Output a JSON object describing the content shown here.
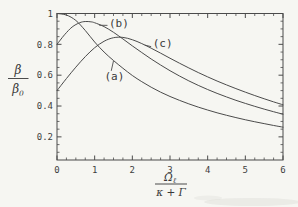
{
  "figure": {
    "background": "#f6f6f2",
    "ink": "#4b4b4b",
    "text_ink": "#3e3e3e"
  },
  "axis_labels": {
    "y_num": "β",
    "y_den_base": "β",
    "y_den_sub": "0",
    "x_num_base": "Ω",
    "x_num_sub": "ℓ",
    "x_den": "κ + Γ"
  },
  "chart_data": {
    "type": "line",
    "title": "",
    "xlabel": "Ω_ℓ / (κ + Γ)",
    "ylabel": "β / β_0",
    "xlim": [
      0,
      6
    ],
    "ylim": [
      0.05,
      1.0
    ],
    "x_ticks": [
      0,
      1,
      2,
      3,
      4,
      5,
      6
    ],
    "y_ticks": [
      0.2,
      0.4,
      0.6,
      0.8,
      1
    ],
    "x_minor_step": 0.25,
    "y_minor_step": 0.05,
    "grid": false,
    "frame": true,
    "legend_position": "none",
    "series": [
      {
        "name": "(a)",
        "points": [
          [
            0,
            1.0
          ],
          [
            0.25,
            0.99
          ],
          [
            0.5,
            0.955
          ],
          [
            0.75,
            0.89
          ],
          [
            1,
            0.815
          ],
          [
            1.25,
            0.75
          ],
          [
            1.5,
            0.695
          ],
          [
            1.75,
            0.645
          ],
          [
            2,
            0.598
          ],
          [
            2.25,
            0.558
          ],
          [
            2.5,
            0.522
          ],
          [
            2.75,
            0.49
          ],
          [
            3,
            0.462
          ],
          [
            3.25,
            0.437
          ],
          [
            3.5,
            0.414
          ],
          [
            3.75,
            0.393
          ],
          [
            4,
            0.374
          ],
          [
            4.25,
            0.356
          ],
          [
            4.5,
            0.34
          ],
          [
            4.75,
            0.325
          ],
          [
            5,
            0.311
          ],
          [
            5.25,
            0.298
          ],
          [
            5.5,
            0.286
          ],
          [
            5.75,
            0.274
          ],
          [
            6,
            0.263
          ]
        ]
      },
      {
        "name": "(b)",
        "points": [
          [
            0,
            0.8
          ],
          [
            0.2,
            0.862
          ],
          [
            0.4,
            0.912
          ],
          [
            0.6,
            0.94
          ],
          [
            0.75,
            0.948
          ],
          [
            0.9,
            0.946
          ],
          [
            1,
            0.94
          ],
          [
            1.25,
            0.915
          ],
          [
            1.5,
            0.878
          ],
          [
            1.75,
            0.835
          ],
          [
            2,
            0.79
          ],
          [
            2.25,
            0.747
          ],
          [
            2.5,
            0.705
          ],
          [
            2.75,
            0.666
          ],
          [
            3,
            0.629
          ],
          [
            3.25,
            0.595
          ],
          [
            3.5,
            0.563
          ],
          [
            3.75,
            0.534
          ],
          [
            4,
            0.507
          ],
          [
            4.25,
            0.482
          ],
          [
            4.5,
            0.459
          ],
          [
            4.75,
            0.437
          ],
          [
            5,
            0.417
          ],
          [
            5.25,
            0.398
          ],
          [
            5.5,
            0.38
          ],
          [
            5.75,
            0.363
          ],
          [
            6,
            0.347
          ]
        ]
      },
      {
        "name": "(c)",
        "points": [
          [
            0,
            0.5
          ],
          [
            0.25,
            0.578
          ],
          [
            0.5,
            0.652
          ],
          [
            0.75,
            0.72
          ],
          [
            1,
            0.778
          ],
          [
            1.25,
            0.82
          ],
          [
            1.5,
            0.843
          ],
          [
            1.75,
            0.845
          ],
          [
            2,
            0.83
          ],
          [
            2.25,
            0.805
          ],
          [
            2.5,
            0.775
          ],
          [
            2.75,
            0.743
          ],
          [
            3,
            0.71
          ],
          [
            3.25,
            0.678
          ],
          [
            3.5,
            0.647
          ],
          [
            3.75,
            0.617
          ],
          [
            4,
            0.589
          ],
          [
            4.25,
            0.562
          ],
          [
            4.5,
            0.537
          ],
          [
            4.75,
            0.513
          ],
          [
            5,
            0.49
          ],
          [
            5.25,
            0.468
          ],
          [
            5.5,
            0.447
          ],
          [
            5.75,
            0.427
          ],
          [
            6,
            0.408
          ]
        ]
      }
    ],
    "annotations": [
      {
        "label": "(a)",
        "text_at": [
          1.26,
          0.572
        ],
        "leader_from": [
          1.44,
          0.628
        ],
        "leader_to": [
          1.5,
          0.693
        ]
      },
      {
        "label": "(b)",
        "text_at": [
          1.38,
          0.912
        ],
        "leader_from": [
          1.34,
          0.923
        ],
        "leader_to": [
          1.12,
          0.924
        ]
      },
      {
        "label": "(c)",
        "text_at": [
          2.54,
          0.782
        ],
        "leader_from": [
          2.5,
          0.785
        ],
        "leader_to": [
          2.33,
          0.795
        ]
      }
    ]
  }
}
